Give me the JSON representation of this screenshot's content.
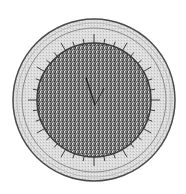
{
  "image": {
    "description": "Grayscale engraving-style illustration of a circular dial-like disk with a stippled dark center, light outer rim and radial tick marks",
    "colors": {
      "background": "#ffffff",
      "rim": "#d9d9d9",
      "rim_edge": "#4a4a4a",
      "inner_ring": "#8a8a8a",
      "disk": "#6e6e6e",
      "disk_dark": "#3a3a3a",
      "tick": "#2a2a2a"
    },
    "geometry": {
      "cx": 94,
      "cy": 100,
      "outer_radius": 81,
      "ring_radius": 72,
      "disk_radius": 57,
      "tick_count": 36
    }
  }
}
